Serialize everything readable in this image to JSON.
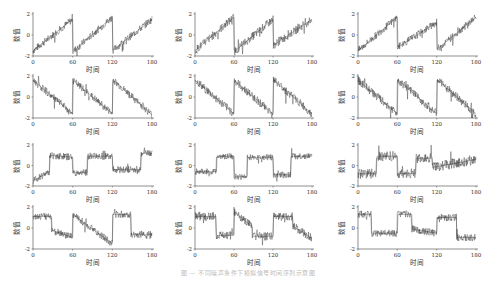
{
  "figure": {
    "caption": "图 — 不同噪声条件下模拟信号时间序列示意图",
    "caption_note": "caption text is faint/illegible in source; approximate"
  },
  "chart_data": {
    "type": "line",
    "layout": {
      "rows": 4,
      "cols": 3,
      "grid": false,
      "legend": false
    },
    "shared": {
      "xlabel": "时间",
      "ylabel": "数值",
      "xlim": [
        0,
        180
      ],
      "ylim": [
        -2,
        2
      ],
      "xticks": [
        0,
        60,
        120,
        180
      ],
      "yticks": [
        2,
        0,
        -2
      ]
    },
    "panels": [
      {
        "row": 0,
        "col": 0,
        "pattern": "sawtooth-up",
        "segments": [
          [
            0,
            -1.5,
            60,
            1.5
          ],
          [
            60,
            -1.6,
            120,
            1.7
          ],
          [
            120,
            -1.5,
            180,
            1.5
          ]
        ],
        "noise": 0.35
      },
      {
        "row": 0,
        "col": 1,
        "pattern": "sawtooth-up",
        "segments": [
          [
            0,
            -1.5,
            60,
            1.7
          ],
          [
            60,
            -1.6,
            120,
            1.5
          ],
          [
            120,
            -1.0,
            180,
            1.5
          ]
        ],
        "noise": 0.4
      },
      {
        "row": 0,
        "col": 2,
        "pattern": "sawtooth-up",
        "segments": [
          [
            0,
            -1.5,
            60,
            1.7
          ],
          [
            60,
            -1.2,
            120,
            1.2
          ],
          [
            120,
            -1.4,
            180,
            1.7
          ]
        ],
        "noise": 0.35
      },
      {
        "row": 1,
        "col": 0,
        "pattern": "sawtooth-down",
        "segments": [
          [
            0,
            1.6,
            60,
            -1.6
          ],
          [
            60,
            1.6,
            120,
            -1.6
          ],
          [
            120,
            1.7,
            180,
            -1.7
          ]
        ],
        "noise": 0.35
      },
      {
        "row": 1,
        "col": 1,
        "pattern": "sawtooth-down",
        "segments": [
          [
            0,
            1.6,
            60,
            -1.6
          ],
          [
            60,
            1.6,
            120,
            -1.6
          ],
          [
            120,
            1.7,
            180,
            -1.6
          ]
        ],
        "noise": 0.4
      },
      {
        "row": 1,
        "col": 2,
        "pattern": "sawtooth-down",
        "segments": [
          [
            0,
            1.6,
            60,
            -1.6
          ],
          [
            60,
            1.7,
            120,
            -1.6
          ],
          [
            120,
            1.7,
            180,
            -1.6
          ]
        ],
        "noise": 0.4
      },
      {
        "row": 2,
        "col": 0,
        "pattern": "steps",
        "segments": [
          [
            0,
            -1.5,
            25,
            -0.6
          ],
          [
            25,
            1.0,
            60,
            0.8
          ],
          [
            60,
            -0.7,
            82,
            -0.7
          ],
          [
            82,
            0.9,
            120,
            0.9
          ],
          [
            120,
            -0.4,
            163,
            -0.4
          ],
          [
            163,
            1.2,
            180,
            1.2
          ]
        ],
        "noise": 0.35
      },
      {
        "row": 2,
        "col": 1,
        "pattern": "steps",
        "segments": [
          [
            0,
            -0.6,
            33,
            -0.6
          ],
          [
            33,
            0.9,
            60,
            0.9
          ],
          [
            60,
            -1.1,
            80,
            -1.1
          ],
          [
            80,
            0.8,
            120,
            0.8
          ],
          [
            120,
            -0.9,
            147,
            -0.9
          ],
          [
            147,
            0.9,
            180,
            0.9
          ]
        ],
        "noise": 0.3
      },
      {
        "row": 2,
        "col": 2,
        "pattern": "steps",
        "segments": [
          [
            0,
            -0.8,
            28,
            -0.8
          ],
          [
            28,
            0.9,
            60,
            0.9
          ],
          [
            60,
            -0.8,
            88,
            -0.8
          ],
          [
            88,
            0.7,
            113,
            0.7
          ],
          [
            113,
            -0.2,
            180,
            0.6
          ]
        ],
        "noise": 0.5
      },
      {
        "row": 3,
        "col": 0,
        "pattern": "steps-ramp",
        "segments": [
          [
            0,
            1.1,
            28,
            1.1
          ],
          [
            28,
            -0.2,
            60,
            -0.9
          ],
          [
            60,
            1.3,
            120,
            -1.5
          ],
          [
            120,
            1.3,
            148,
            1.3
          ],
          [
            148,
            -0.6,
            180,
            -0.6
          ]
        ],
        "noise": 0.35
      },
      {
        "row": 3,
        "col": 1,
        "pattern": "steps-ramp",
        "segments": [
          [
            0,
            1.1,
            32,
            1.1
          ],
          [
            32,
            -0.7,
            60,
            -0.7
          ],
          [
            60,
            1.6,
            88,
            0.1
          ],
          [
            88,
            -0.8,
            120,
            -0.8
          ],
          [
            120,
            1.1,
            150,
            1.1
          ],
          [
            150,
            0.2,
            180,
            -1.0
          ]
        ],
        "noise": 0.4
      },
      {
        "row": 3,
        "col": 2,
        "pattern": "steps",
        "segments": [
          [
            0,
            1.3,
            20,
            1.3
          ],
          [
            20,
            -0.5,
            60,
            -0.5
          ],
          [
            60,
            1.3,
            82,
            1.3
          ],
          [
            82,
            -0.1,
            120,
            -0.5
          ],
          [
            120,
            1.0,
            150,
            1.0
          ],
          [
            150,
            -0.9,
            180,
            -0.9
          ]
        ],
        "noise": 0.35
      }
    ]
  },
  "style": {
    "line_color": "#2b2b2b",
    "axis_color": "#444444",
    "text_color": "#333333"
  }
}
